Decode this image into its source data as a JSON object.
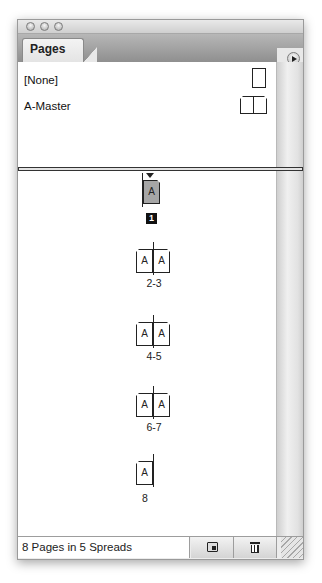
{
  "window": {
    "controls": [
      "close",
      "minimize",
      "zoom"
    ]
  },
  "panel": {
    "tab_label": "Pages",
    "menu_icon": "panel-menu-arrow-icon"
  },
  "masters": [
    {
      "name": "[None]",
      "icon": "single-page-icon"
    },
    {
      "name": "A-Master",
      "icon": "facing-pages-icon"
    }
  ],
  "pages": {
    "spreads": [
      {
        "label": "1",
        "pages": [
          "A"
        ],
        "selected": true,
        "layout": "right-only"
      },
      {
        "label": "2-3",
        "pages": [
          "A",
          "A"
        ],
        "selected": false,
        "layout": "facing"
      },
      {
        "label": "4-5",
        "pages": [
          "A",
          "A"
        ],
        "selected": false,
        "layout": "facing"
      },
      {
        "label": "6-7",
        "pages": [
          "A",
          "A"
        ],
        "selected": false,
        "layout": "facing"
      },
      {
        "label": "8",
        "pages": [
          "A"
        ],
        "selected": false,
        "layout": "left-only"
      }
    ]
  },
  "footer": {
    "status": "8 Pages in 5 Spreads",
    "new_page_icon": "new-page-icon",
    "delete_icon": "trash-icon"
  }
}
